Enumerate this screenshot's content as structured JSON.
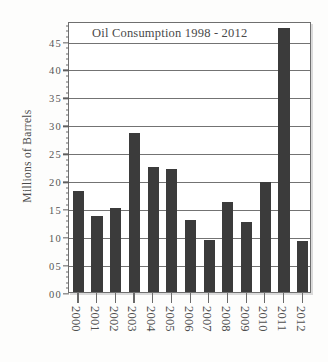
{
  "chart_data": {
    "type": "bar",
    "title": "Oil Consumption 1998 - 2012",
    "xlabel": "",
    "ylabel": "Millions of Barrels",
    "categories": [
      "2000",
      "2001",
      "2002",
      "2003",
      "2004",
      "2005",
      "2006",
      "2007",
      "2008",
      "2009",
      "2010",
      "2011",
      "2012"
    ],
    "values": [
      18.1,
      13.6,
      15.0,
      28.5,
      22.4,
      22.1,
      12.8,
      9.3,
      16.1,
      12.5,
      19.7,
      47.2,
      9.2
    ],
    "ylim": [
      0,
      48.5
    ],
    "ytick_values": [
      0,
      5,
      10,
      15,
      20,
      25,
      30,
      35,
      40,
      45
    ],
    "ytick_labels": [
      "00",
      "05",
      "10",
      "15",
      "20",
      "25",
      "30",
      "35",
      "40",
      "45"
    ],
    "minor_ticks_between_majors": 4,
    "grid": true,
    "grid_axis": "y",
    "legend": null,
    "legend_position": "none",
    "bar_color": "#3b3b3b",
    "background_color": "#ffffff",
    "axis_color": "#6f6f6f",
    "text_color": "#4a4a4a",
    "xlabel_rotation": 90
  }
}
